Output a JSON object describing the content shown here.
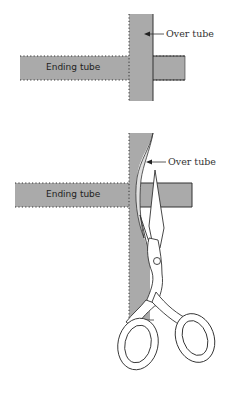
{
  "figure": {
    "colors": {
      "tube_fill": "#aaaaaa",
      "tube_stroke": "#333333",
      "scissors_fill": "#ffffff",
      "scissors_stroke": "#333333",
      "background": "#ffffff"
    },
    "panels": [
      {
        "id": "before-cut",
        "ending_tube_label": "Ending tube",
        "over_tube_label": "Over tube"
      },
      {
        "id": "cutting",
        "ending_tube_label": "Ending tube",
        "over_tube_label": "Over tube",
        "tool": "scissors-icon"
      }
    ]
  }
}
